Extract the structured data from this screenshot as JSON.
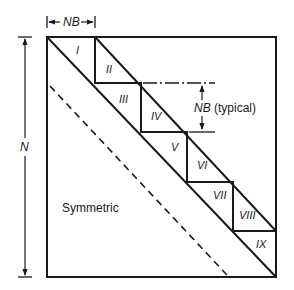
{
  "diagram": {
    "labels": {
      "nb_top": "NB",
      "n_side": "N",
      "nb_typical_prefix": "NB",
      "nb_typical_suffix": " (typical)",
      "symmetric": "Symmetric"
    },
    "blocks": [
      {
        "id": "I",
        "label": "I"
      },
      {
        "id": "II",
        "label": "II"
      },
      {
        "id": "III",
        "label": "III"
      },
      {
        "id": "IV",
        "label": "IV"
      },
      {
        "id": "V",
        "label": "V"
      },
      {
        "id": "VI",
        "label": "VI"
      },
      {
        "id": "VII",
        "label": "VII"
      },
      {
        "id": "VIII",
        "label": "VIII"
      },
      {
        "id": "IX",
        "label": "IX"
      }
    ],
    "colors": {
      "line": "#1a1a1a",
      "background": "#ffffff"
    }
  }
}
